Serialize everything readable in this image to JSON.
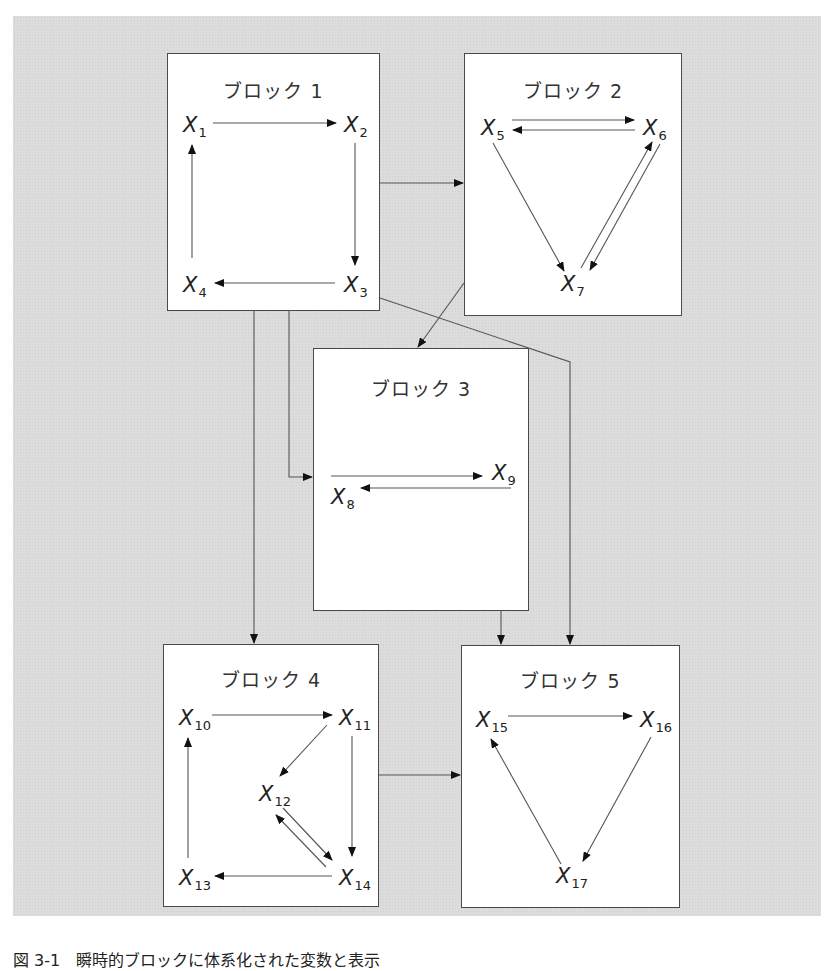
{
  "figure": {
    "caption": "図 3-1　瞬時的ブロックに体系化された変数と表示",
    "background_color": "#dcdcdc",
    "line_color": "#555555",
    "blocks": [
      {
        "id": "block1",
        "title": "ブロック 1",
        "nodes": [
          {
            "label": "X",
            "sub": "1"
          },
          {
            "label": "X",
            "sub": "2"
          },
          {
            "label": "X",
            "sub": "3"
          },
          {
            "label": "X",
            "sub": "4"
          }
        ],
        "edges": [
          "X1→X2",
          "X2→X3",
          "X3→X4",
          "X4→X1"
        ]
      },
      {
        "id": "block2",
        "title": "ブロック 2",
        "nodes": [
          {
            "label": "X",
            "sub": "5"
          },
          {
            "label": "X",
            "sub": "6"
          },
          {
            "label": "X",
            "sub": "7"
          }
        ],
        "edges": [
          "X5→X6",
          "X6→X5",
          "X5→X7",
          "X6→X7",
          "X7→X6"
        ]
      },
      {
        "id": "block3",
        "title": "ブロック 3",
        "nodes": [
          {
            "label": "X",
            "sub": "8"
          },
          {
            "label": "X",
            "sub": "9"
          }
        ],
        "edges": [
          "X8→X9",
          "X9→X8"
        ]
      },
      {
        "id": "block4",
        "title": "ブロック 4",
        "nodes": [
          {
            "label": "X",
            "sub": "10"
          },
          {
            "label": "X",
            "sub": "11"
          },
          {
            "label": "X",
            "sub": "12"
          },
          {
            "label": "X",
            "sub": "13"
          },
          {
            "label": "X",
            "sub": "14"
          }
        ],
        "edges": [
          "X10→X11",
          "X11→X12",
          "X11→X14",
          "X12→X14",
          "X14→X12",
          "X14→X13",
          "X13→X10"
        ]
      },
      {
        "id": "block5",
        "title": "ブロック 5",
        "nodes": [
          {
            "label": "X",
            "sub": "15"
          },
          {
            "label": "X",
            "sub": "16"
          },
          {
            "label": "X",
            "sub": "17"
          }
        ],
        "edges": [
          "X15→X16",
          "X16→X17",
          "X17→X15"
        ]
      }
    ],
    "block_edges": [
      "block1→block2",
      "block1→block3",
      "block1→block4",
      "block1→block5",
      "block2→block3",
      "block3→block5",
      "block4→block5"
    ]
  }
}
